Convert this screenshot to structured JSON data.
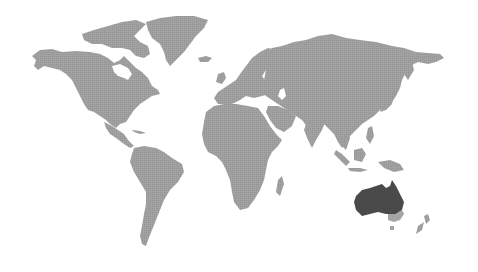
{
  "map": {
    "type": "world-choropleth",
    "colors": {
      "background": "#ffffff",
      "land": "#9e9e9e",
      "highlight": "#4a4a4a",
      "secondary": "#a4a4a4"
    },
    "highlighted_region": "Australia",
    "regions": [
      {
        "name": "North America",
        "state": "default"
      },
      {
        "name": "Greenland",
        "state": "default"
      },
      {
        "name": "South America",
        "state": "default"
      },
      {
        "name": "Europe",
        "state": "default"
      },
      {
        "name": "Africa",
        "state": "default"
      },
      {
        "name": "Asia",
        "state": "default"
      },
      {
        "name": "Southeast Asia",
        "state": "default"
      },
      {
        "name": "Australia",
        "state": "highlighted"
      },
      {
        "name": "New Zealand",
        "state": "default"
      }
    ]
  }
}
